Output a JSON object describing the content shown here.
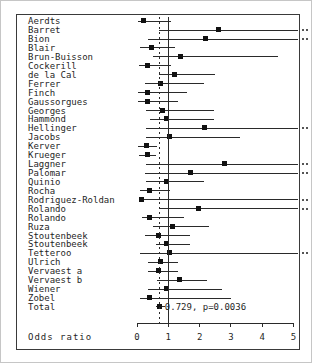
{
  "figure": {
    "xlabel": "Odds ratio",
    "total_annotation": "0.729, p=0.0036"
  },
  "chart_data": {
    "type": "scatter",
    "subtype": "forest-plot",
    "title": "",
    "xlabel": "Odds ratio",
    "ylabel": "",
    "xlim": [
      0,
      5
    ],
    "x_ticks": [
      0,
      1,
      2,
      3,
      4,
      5
    ],
    "grid": false,
    "legend": false,
    "reference_lines": [
      {
        "x": 1.0,
        "style": "solid"
      },
      {
        "x": 0.729,
        "style": "dashed"
      }
    ],
    "total_annotation": "0.729, p=0.0036",
    "studies": [
      {
        "name": "Aerdts",
        "or": 0.2,
        "ci_low": 0.02,
        "ci_high": 1.1,
        "ci_high_exceeds_axis": false
      },
      {
        "name": "Barret",
        "or": 2.6,
        "ci_low": 0.7,
        "ci_high": 5.0,
        "ci_high_exceeds_axis": true
      },
      {
        "name": "Bion",
        "or": 2.2,
        "ci_low": 0.35,
        "ci_high": 5.0,
        "ci_high_exceeds_axis": true
      },
      {
        "name": "Blair",
        "or": 0.45,
        "ci_low": 0.1,
        "ci_high": 1.2,
        "ci_high_exceeds_axis": false
      },
      {
        "name": "Brun-Buisson",
        "or": 1.4,
        "ci_low": 0.5,
        "ci_high": 4.5,
        "ci_high_exceeds_axis": false
      },
      {
        "name": "Cockerill",
        "or": 0.35,
        "ci_low": 0.05,
        "ci_high": 1.1,
        "ci_high_exceeds_axis": false
      },
      {
        "name": "de la Cal",
        "or": 1.2,
        "ci_low": 0.7,
        "ci_high": 2.5,
        "ci_high_exceeds_axis": false
      },
      {
        "name": "Ferrer",
        "or": 0.75,
        "ci_low": 0.25,
        "ci_high": 2.15,
        "ci_high_exceeds_axis": false
      },
      {
        "name": "Finch",
        "or": 0.35,
        "ci_low": 0.02,
        "ci_high": 1.6,
        "ci_high_exceeds_axis": false
      },
      {
        "name": "Gaussorgues",
        "or": 0.35,
        "ci_low": 0.02,
        "ci_high": 1.3,
        "ci_high_exceeds_axis": false
      },
      {
        "name": "Georges",
        "or": 0.8,
        "ci_low": 0.3,
        "ci_high": 2.45,
        "ci_high_exceeds_axis": false
      },
      {
        "name": "Hammond",
        "or": 0.95,
        "ci_low": 0.4,
        "ci_high": 2.45,
        "ci_high_exceeds_axis": false
      },
      {
        "name": "Hellinger",
        "or": 2.15,
        "ci_low": 0.3,
        "ci_high": 5.0,
        "ci_high_exceeds_axis": true
      },
      {
        "name": "Jacobs",
        "or": 1.05,
        "ci_low": 0.3,
        "ci_high": 3.3,
        "ci_high_exceeds_axis": false
      },
      {
        "name": "Kerver",
        "or": 0.3,
        "ci_low": 0.02,
        "ci_high": 0.65,
        "ci_high_exceeds_axis": false
      },
      {
        "name": "Krueger",
        "or": 0.35,
        "ci_low": 0.05,
        "ci_high": 0.6,
        "ci_high_exceeds_axis": false
      },
      {
        "name": "Laggner",
        "or": 2.8,
        "ci_low": 0.3,
        "ci_high": 5.0,
        "ci_high_exceeds_axis": true
      },
      {
        "name": "Palomar",
        "or": 1.7,
        "ci_low": 0.25,
        "ci_high": 5.0,
        "ci_high_exceeds_axis": true
      },
      {
        "name": "Quinio",
        "or": 0.95,
        "ci_low": 0.3,
        "ci_high": 2.15,
        "ci_high_exceeds_axis": false
      },
      {
        "name": "Rocha",
        "or": 0.4,
        "ci_low": 0.1,
        "ci_high": 1.05,
        "ci_high_exceeds_axis": false
      },
      {
        "name": "Rodriguez-Roldan",
        "or": 0.15,
        "ci_low": 0.05,
        "ci_high": 5.0,
        "ci_high_exceeds_axis": true
      },
      {
        "name": "Rolando",
        "or": 1.95,
        "ci_low": 0.7,
        "ci_high": 5.0,
        "ci_high_exceeds_axis": true
      },
      {
        "name": "Rolando",
        "or": 0.4,
        "ci_low": 0.15,
        "ci_high": 1.5,
        "ci_high_exceeds_axis": false
      },
      {
        "name": "Ruza",
        "or": 1.15,
        "ci_low": 0.5,
        "ci_high": 2.3,
        "ci_high_exceeds_axis": false
      },
      {
        "name": "Stoutenbeek",
        "or": 0.7,
        "ci_low": 0.25,
        "ci_high": 1.7,
        "ci_high_exceeds_axis": false
      },
      {
        "name": "Stoutenbeek",
        "or": 0.95,
        "ci_low": 0.6,
        "ci_high": 1.7,
        "ci_high_exceeds_axis": false
      },
      {
        "name": "Tetteroo",
        "or": 1.05,
        "ci_low": 0.1,
        "ci_high": 5.0,
        "ci_high_exceeds_axis": true
      },
      {
        "name": "Ulrich",
        "or": 0.75,
        "ci_low": 0.35,
        "ci_high": 1.3,
        "ci_high_exceeds_axis": false
      },
      {
        "name": "Vervaest a",
        "or": 0.7,
        "ci_low": 0.35,
        "ci_high": 1.3,
        "ci_high_exceeds_axis": false
      },
      {
        "name": "Vervaest b",
        "or": 1.35,
        "ci_low": 0.65,
        "ci_high": 2.25,
        "ci_high_exceeds_axis": false
      },
      {
        "name": "Wiener",
        "or": 0.95,
        "ci_low": 0.35,
        "ci_high": 2.7,
        "ci_high_exceeds_axis": false
      },
      {
        "name": "Zobel",
        "or": 0.4,
        "ci_low": 0.1,
        "ci_high": 3.0,
        "ci_high_exceeds_axis": false
      },
      {
        "name": "Total",
        "or": 0.729,
        "ci_low": 0.6,
        "ci_high": 0.9,
        "ci_high_exceeds_axis": false,
        "is_total": true,
        "annotation": "0.729, p=0.0036"
      }
    ],
    "colors": {
      "marker": "#111111",
      "line": "#2a2a2a",
      "frame": "#3a3a3a",
      "background": "#ffffff"
    }
  }
}
